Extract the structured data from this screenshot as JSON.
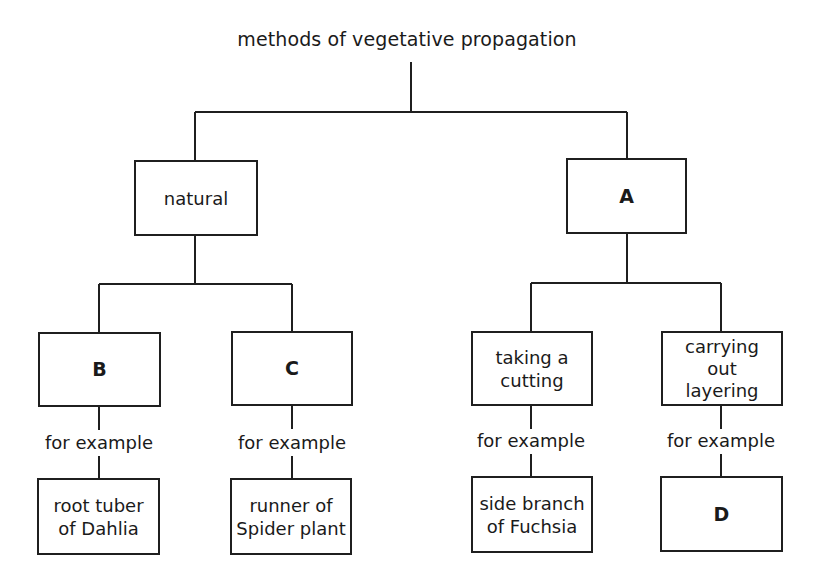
{
  "diagram": {
    "title": "methods of vegetative propagation",
    "level1": {
      "natural": {
        "label": "natural"
      },
      "artificial": {
        "label": "A"
      }
    },
    "level2": {
      "b": {
        "label": "B"
      },
      "c": {
        "label": "C"
      },
      "cutting": {
        "label": "taking a cutting",
        "lines": [
          "taking a",
          "cutting"
        ]
      },
      "layering": {
        "label": "carrying out layering",
        "lines": [
          "carrying",
          "out",
          "layering"
        ]
      }
    },
    "connector_label": "for example",
    "examples": {
      "b": {
        "label": "root tuber of Dahlia",
        "lines": [
          "root tuber",
          "of Dahlia"
        ]
      },
      "c": {
        "label": "runner of Spider plant",
        "lines": [
          "runner of",
          "Spider plant"
        ]
      },
      "cutting": {
        "label": "side branch of Fuchsia",
        "lines": [
          "side branch",
          "of Fuchsia"
        ]
      },
      "layering": {
        "label": "D"
      }
    }
  }
}
